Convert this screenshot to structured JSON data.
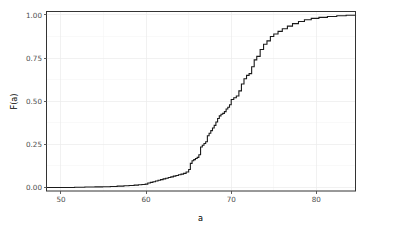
{
  "chart_data": {
    "type": "line",
    "subtype": "ecdf-step",
    "title": "",
    "subtitle": "",
    "xlabel": "a",
    "ylabel": "F(a)",
    "xlim": [
      48.3,
      84.6
    ],
    "ylim": [
      -0.02,
      1.02
    ],
    "grid": true,
    "legend": null,
    "x_ticks": [
      50,
      60,
      70,
      80
    ],
    "x_tick_labels": [
      "50",
      "60",
      "70",
      "80"
    ],
    "x_minor_ticks": [
      55,
      65,
      75
    ],
    "y_ticks": [
      0.0,
      0.25,
      0.5,
      0.75,
      1.0
    ],
    "y_tick_labels": [
      "0.00",
      "0.25",
      "0.50",
      "0.75",
      "1.00"
    ],
    "y_minor_ticks": [
      0.125,
      0.375,
      0.625,
      0.875
    ],
    "series": [
      {
        "name": "F(a)",
        "color": "#1a1a1a",
        "x": [
          48.3,
          49.2,
          50.4,
          51.6,
          52.8,
          54.0,
          54.9,
          55.8,
          56.6,
          57.4,
          58.0,
          58.6,
          59.1,
          59.5,
          59.9,
          60.2,
          60.5,
          60.8,
          61.1,
          61.4,
          61.7,
          62.0,
          62.3,
          62.6,
          62.9,
          63.2,
          63.5,
          63.8,
          64.1,
          64.4,
          64.7,
          65.0,
          65.2,
          65.4,
          65.6,
          65.8,
          66.0,
          66.2,
          66.4,
          66.6,
          66.8,
          67.0,
          67.2,
          67.4,
          67.6,
          67.8,
          68.0,
          68.2,
          68.4,
          68.6,
          68.8,
          69.0,
          69.2,
          69.4,
          69.6,
          69.8,
          70.0,
          70.3,
          70.6,
          70.9,
          71.2,
          71.5,
          71.8,
          72.1,
          72.4,
          72.7,
          73.0,
          73.4,
          73.8,
          74.2,
          74.6,
          75.0,
          75.5,
          76.0,
          76.6,
          77.2,
          77.9,
          78.6,
          79.4,
          80.3,
          81.3,
          82.4,
          83.5,
          84.6
        ],
        "y": [
          0.0,
          0.0,
          0.0,
          0.002,
          0.003,
          0.004,
          0.005,
          0.006,
          0.008,
          0.01,
          0.012,
          0.014,
          0.016,
          0.018,
          0.02,
          0.026,
          0.03,
          0.034,
          0.038,
          0.042,
          0.046,
          0.05,
          0.054,
          0.058,
          0.062,
          0.066,
          0.07,
          0.074,
          0.078,
          0.082,
          0.09,
          0.105,
          0.14,
          0.155,
          0.162,
          0.168,
          0.175,
          0.19,
          0.235,
          0.245,
          0.255,
          0.265,
          0.3,
          0.315,
          0.33,
          0.345,
          0.36,
          0.38,
          0.4,
          0.415,
          0.425,
          0.43,
          0.44,
          0.455,
          0.465,
          0.48,
          0.51,
          0.52,
          0.53,
          0.56,
          0.6,
          0.63,
          0.65,
          0.66,
          0.7,
          0.74,
          0.76,
          0.8,
          0.83,
          0.85,
          0.875,
          0.89,
          0.905,
          0.92,
          0.935,
          0.95,
          0.962,
          0.972,
          0.98,
          0.986,
          0.991,
          0.995,
          0.998,
          1.0
        ]
      }
    ]
  },
  "axes": {
    "x_title": "a",
    "y_title": "F(a)"
  }
}
